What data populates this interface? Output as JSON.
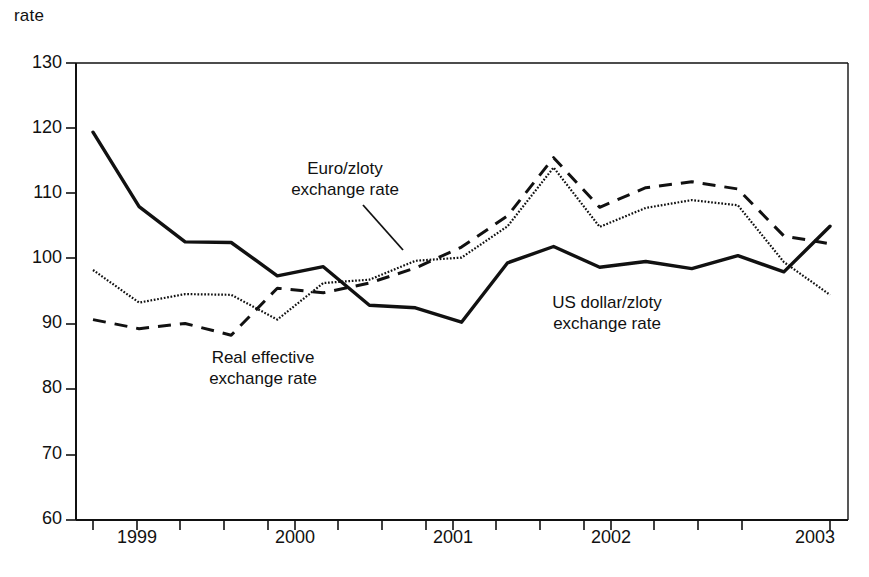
{
  "chart_data": {
    "type": "line",
    "title": "",
    "xlabel": "",
    "ylabel": "rate",
    "ylim": [
      60,
      130
    ],
    "yticks": [
      60,
      70,
      80,
      90,
      100,
      110,
      120,
      130
    ],
    "xticks_labeled": [
      "1999",
      "2000",
      "2001",
      "2002",
      "2003"
    ],
    "x_tick_frequency": "quarterly",
    "grid": false,
    "legend_position": "inline-annotations",
    "x": [
      "1998Q4",
      "1999Q1",
      "1999Q2",
      "1999Q3",
      "1999Q4",
      "2000Q1",
      "2000Q2",
      "2000Q3",
      "2000Q4",
      "2001Q1",
      "2001Q2",
      "2001Q3",
      "2001Q4",
      "2002Q1",
      "2002Q2",
      "2002Q3",
      "2002Q4"
    ],
    "series": [
      {
        "name": "US dollar/zloty exchange rate",
        "style": "solid",
        "values": [
          119.4,
          108.0,
          102.6,
          102.5,
          97.4,
          98.8,
          92.9,
          92.5,
          90.3,
          99.4,
          101.9,
          98.7,
          99.6,
          98.5,
          100.5,
          98.0,
          105.0
        ]
      },
      {
        "name": "Euro/zloty exchange rate",
        "style": "dotted",
        "values": [
          98.3,
          93.3,
          94.6,
          94.5,
          90.7,
          96.3,
          96.8,
          99.7,
          100.2,
          105.0,
          114.0,
          104.9,
          107.8,
          109.0,
          108.2,
          99.5,
          94.5
        ]
      },
      {
        "name": "Real effective exchange rate",
        "style": "dashed",
        "values": [
          90.7,
          89.3,
          90.1,
          88.3,
          95.5,
          94.8,
          96.3,
          98.6,
          101.8,
          106.6,
          115.5,
          107.9,
          110.9,
          111.8,
          110.7,
          103.5,
          102.3
        ]
      }
    ],
    "annotations": [
      {
        "id": "euro-zloty",
        "text": "Euro/zloty\nexchange rate",
        "leader": true
      },
      {
        "id": "real-effective",
        "text": "Real effective\nexchange rate",
        "leader": false
      },
      {
        "id": "us-dollar-zloty",
        "text": "US dollar/zloty\nexchange rate",
        "leader": false
      }
    ],
    "colors": {
      "line": "#111111",
      "axis": "#111111",
      "background": "#ffffff"
    }
  }
}
